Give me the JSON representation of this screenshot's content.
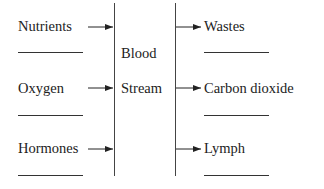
{
  "diagram": {
    "center_label": [
      "Blood",
      "Stream"
    ],
    "inputs": [
      {
        "label": "Nutrients",
        "blank": ""
      },
      {
        "label": "Oxygen",
        "blank": ""
      },
      {
        "label": "Hormones",
        "blank": ""
      }
    ],
    "outputs": [
      {
        "label": "Wastes",
        "blank": ""
      },
      {
        "label": "Carbon dioxide",
        "blank": ""
      },
      {
        "label": "Lymph",
        "blank": ""
      }
    ]
  }
}
